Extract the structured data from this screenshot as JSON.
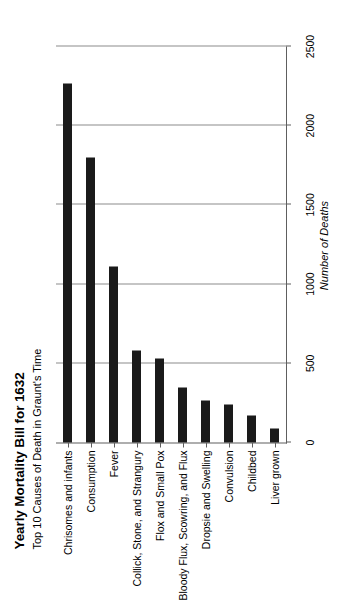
{
  "chart_data": {
    "type": "bar",
    "orientation": "vertical-rotated",
    "title": "Yearly Mortality Bill for 1632",
    "subtitle": "Top 10 Causes of Death in Graunt's Time",
    "xlabel": "",
    "ylabel": "Number of Deaths",
    "ylim": [
      0,
      2500
    ],
    "grid": true,
    "legend": false,
    "tick_labels": [
      "0",
      "500",
      "1000",
      "1500",
      "2000",
      "2500"
    ],
    "ticks": [
      0,
      500,
      1000,
      1500,
      2000,
      2500
    ],
    "categories": [
      "Chrisomes and infants",
      "Consumption",
      "Fever",
      "Collick, Stone, and Strangury",
      "Flox and Small Pox",
      "Bloody Flux, Scowring, and Flux",
      "Dropsie and Swelling",
      "Convulsion",
      "Childbed",
      "Liver grown"
    ],
    "values": [
      2268,
      1797,
      1108,
      582,
      531,
      348,
      267,
      241,
      171,
      87
    ],
    "bar_color": "#1a1a1a",
    "grid_color": "#8c8c8c",
    "axis_color": "#5e5e5e",
    "background": "#ffffff"
  }
}
